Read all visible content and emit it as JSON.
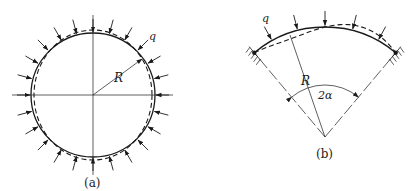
{
  "figure_a": {
    "caption": "(a)",
    "radius_label": "R",
    "load_label": "q",
    "description": "Full circular ring under uniform external radial pressure q; dashed line shows buckled (oval) shape",
    "center": [
      93,
      95
    ],
    "radius": 62,
    "arrow_count": 24
  },
  "figure_b": {
    "caption": "(b)",
    "radius_label": "R",
    "load_label": "q",
    "angle_label": "2α",
    "description": "Circular arch with hinged/fixed supports, central angle 2α, under uniform radial load q; dashed line shows buckled shape",
    "apex": [
      325,
      137
    ],
    "radius": 110,
    "half_angle_deg": 40
  },
  "colors": {
    "line": "#1a1a1a",
    "background": "#ffffff"
  }
}
